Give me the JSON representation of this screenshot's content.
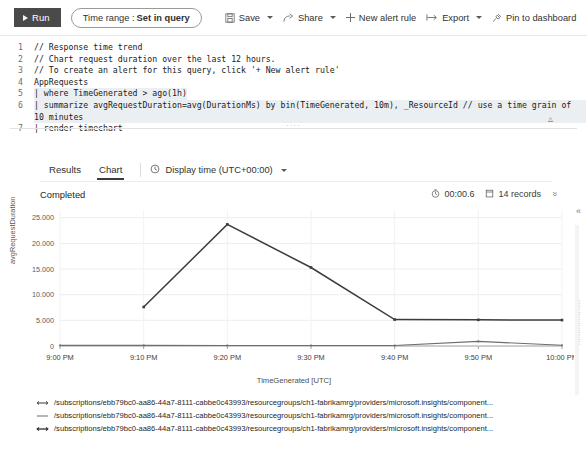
{
  "toolbar": {
    "run_label": "Run",
    "time_range_prefix": "Time range :",
    "time_range_value": "Set in query",
    "save_label": "Save",
    "share_label": "Share",
    "new_alert_label": "New alert rule",
    "export_label": "Export",
    "pin_label": "Pin to dashboard",
    "run_bg": "#4a4a4a"
  },
  "editor": {
    "lines": [
      {
        "n": "1",
        "text": "// Response time trend",
        "highlight": false
      },
      {
        "n": "2",
        "text": "// Chart request duration over the last 12 hours.",
        "highlight": false
      },
      {
        "n": "3",
        "text": "// To create an alert for this query, click '+ New alert rule'",
        "highlight": false
      },
      {
        "n": "4",
        "text": "AppRequests",
        "highlight": false
      },
      {
        "n": "5",
        "text": "| where TimeGenerated > ago(1h)",
        "highlight": true
      },
      {
        "n": "6",
        "text": "| summarize avgRequestDuration=avg(DurationMs) by bin(TimeGenerated, 10m), _ResourceId // use a time grain of 10 minutes",
        "highlight": true
      },
      {
        "n": "7",
        "text": "| render timechart",
        "highlight": false
      }
    ]
  },
  "results": {
    "tabs": [
      {
        "label": "Results",
        "active": false
      },
      {
        "label": "Chart",
        "active": true
      }
    ],
    "display_time_label": "Display time (UTC+00:00)",
    "status": "Completed",
    "duration": "00:00.6",
    "records": "14 records"
  },
  "chart_data": {
    "type": "line",
    "title": "",
    "xlabel": "TimeGenerated [UTC]",
    "ylabel": "avgRequestDuration",
    "grid": true,
    "legend_position": "bottom",
    "x": [
      "9:00 PM",
      "9:10 PM",
      "9:20 PM",
      "9:30 PM",
      "9:40 PM",
      "9:50 PM",
      "10:00 PM"
    ],
    "xtick_labels": [
      "9:00 PM",
      "9:10 PM",
      "9:20 PM",
      "9:30 PM",
      "9:40 PM",
      "9:50 PM",
      "10:00 PM"
    ],
    "ytick_labels": [
      "0",
      "5.000",
      "10.000",
      "15.000",
      "20.000",
      "25.000"
    ],
    "yticks": [
      0,
      5000,
      10000,
      15000,
      20000,
      25000
    ],
    "ylim": [
      0,
      26500
    ],
    "series": [
      {
        "name": "/subscriptions/ebb79bc0-aa86-44a7-8111-cabbe0c43993/resourcegroups/ch1-fabrikamrg/providers/microsoft.insights/component...",
        "color": "#3c3c3c",
        "marker": "arrow-left-right",
        "x": [
          "9:10 PM",
          "9:20 PM",
          "9:30 PM",
          "9:40 PM",
          "9:50 PM",
          "10:00 PM"
        ],
        "values": [
          7600,
          23700,
          15300,
          5150,
          5100,
          5050
        ]
      },
      {
        "name": "/subscriptions/ebb79bc0-aa86-44a7-8111-cabbe0c43993/resourcegroups/ch1-fabrikamrg/providers/microsoft.insights/component...",
        "color": "#6e6e6e",
        "marker": "line",
        "x": [
          "9:00 PM",
          "9:10 PM",
          "9:20 PM",
          "9:30 PM",
          "9:40 PM",
          "9:50 PM",
          "10:00 PM"
        ],
        "values": [
          120,
          110,
          105,
          100,
          95,
          900,
          130
        ]
      },
      {
        "name": "/subscriptions/ebb79bc0-aa86-44a7-8111-cabbe0c43993/resourcegroups/ch1-fabrikamrg/providers/microsoft.insights/component...",
        "color": "#2f2f2f",
        "marker": "arrow-left-right",
        "x": [],
        "values": []
      }
    ]
  },
  "side": {
    "vertical_text": "...................."
  }
}
